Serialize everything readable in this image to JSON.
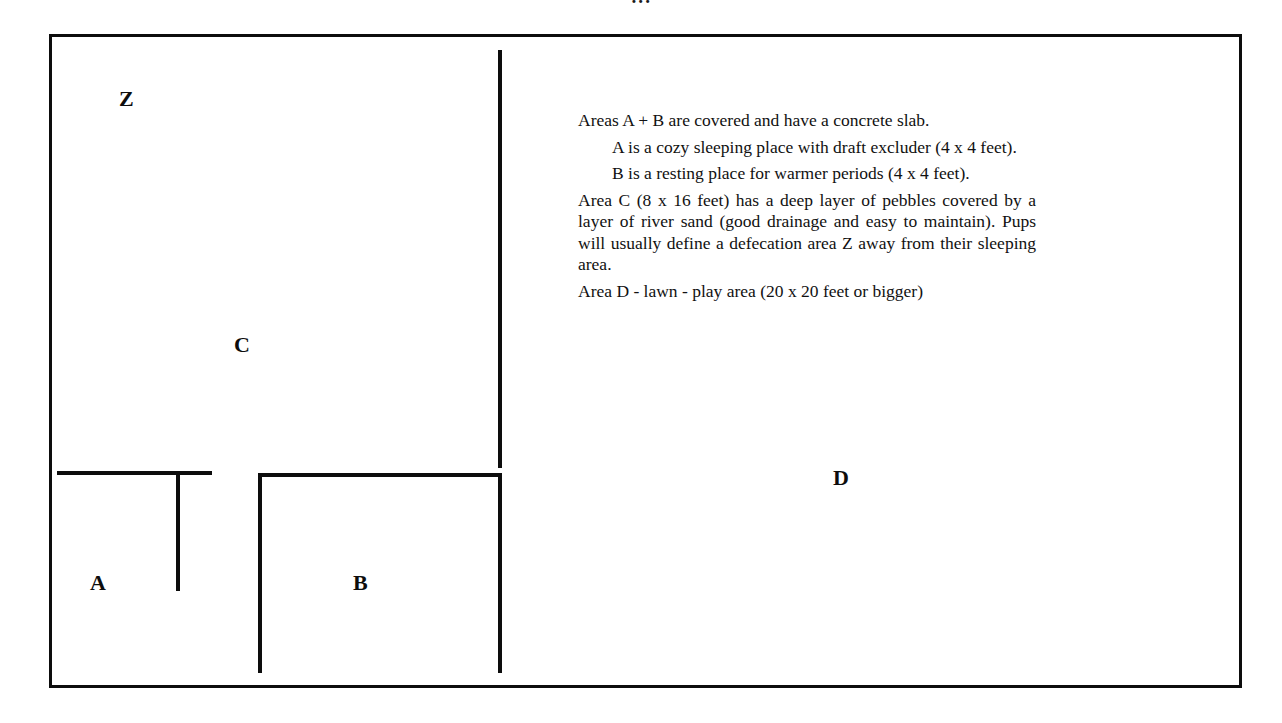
{
  "title_remnant": "···",
  "diagram": {
    "type": "floor-plan",
    "areas": [
      {
        "id": "Z",
        "label": "Z",
        "name": "defecation area"
      },
      {
        "id": "C",
        "label": "C",
        "name": "pebble and river sand run",
        "size": "8 x 16 feet"
      },
      {
        "id": "A",
        "label": "A",
        "name": "cozy sleeping place with draft excluder",
        "size": "4 x 4 feet"
      },
      {
        "id": "B",
        "label": "B",
        "name": "resting place for warmer periods",
        "size": "4 x 4 feet"
      },
      {
        "id": "D",
        "label": "D",
        "name": "lawn - play area",
        "size": "20 x 20 feet or bigger"
      }
    ]
  },
  "legend": {
    "line1": "Areas A + B are covered and have a concrete slab.",
    "line2": "A is a cozy sleeping place with draft excluder (4 x 4 feet).",
    "line3": "B is a resting place for warmer periods (4 x 4 feet).",
    "line4": "Area C (8 x 16 feet) has a deep layer of pebbles covered by a layer of river sand (good drainage and easy to maintain). Pups will usually define a defecation area Z away from their sleeping area.",
    "line5": "Area D - lawn - play area (20 x 20 feet or bigger)"
  },
  "colors": {
    "ink": "#0d0d0d",
    "paper": "#ffffff",
    "text": "#111111"
  }
}
